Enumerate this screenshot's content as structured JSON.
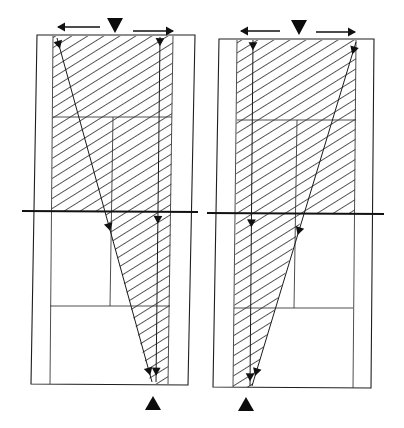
{
  "figure": {
    "colors": {
      "ink": "#111111",
      "hatch": "#444444",
      "background": "#ffffff"
    },
    "hatch": {
      "angle_deg": -32,
      "spacing": 8.5
    },
    "panels": [
      {
        "id": "left",
        "frame": [
          [
            37,
            35
          ],
          [
            195,
            35
          ],
          [
            188,
            385
          ],
          [
            31,
            384
          ]
        ],
        "hatch_regions": [
          [
            [
              53,
              36
            ],
            [
              173,
              36
            ],
            [
              171,
              211
            ],
            [
              52,
              211
            ]
          ],
          [
            [
              105,
              211
            ],
            [
              171,
              211
            ],
            [
              168,
              384
            ],
            [
              151,
              384
            ]
          ]
        ],
        "thin_lines": [
          [
            [
              53,
              36
            ],
            [
              50,
              384
            ]
          ],
          [
            [
              173,
              36
            ],
            [
              168,
              384
            ]
          ],
          [
            [
              53,
              117
            ],
            [
              172,
              117
            ]
          ],
          [
            [
              113,
              117
            ],
            [
              110,
              306
            ]
          ],
          [
            [
              50,
              306
            ],
            [
              170,
              306
            ]
          ]
        ],
        "thick_line": [
          [
            22,
            211
          ],
          [
            198,
            212
          ]
        ],
        "rays": [
          {
            "from": [
              57,
              38
            ],
            "to": [
              152,
              382
            ],
            "heads": [
              0.02,
              0.55,
              0.97
            ]
          },
          {
            "from": [
              160,
              37
            ],
            "to": [
              156,
              382
            ],
            "heads": [
              0.015,
              0.53,
              0.97
            ]
          }
        ],
        "spread_arrows": [
          {
            "from": [
              100,
              27
            ],
            "to": [
              58,
              27
            ]
          },
          {
            "from": [
              133,
              31
            ],
            "to": [
              173,
              31
            ]
          }
        ],
        "top_marker": {
          "x": 115,
          "y": 18,
          "dir": "down"
        },
        "bottom_marker": {
          "x": 153,
          "y": 396,
          "dir": "up"
        }
      },
      {
        "id": "right",
        "frame": [
          [
            219,
            39
          ],
          [
            374,
            39
          ],
          [
            371,
            388
          ],
          [
            213,
            387
          ]
        ],
        "hatch_regions": [
          [
            [
              237,
              40
            ],
            [
              356,
              40
            ],
            [
              355,
              213
            ],
            [
              236,
              213
            ]
          ],
          [
            [
              236,
              213
            ],
            [
              303,
              213
            ],
            [
              252,
              387
            ],
            [
              233,
              387
            ]
          ]
        ],
        "thin_lines": [
          [
            [
              237,
              40
            ],
            [
              233,
              387
            ]
          ],
          [
            [
              356,
              40
            ],
            [
              353,
              388
            ]
          ],
          [
            [
              237,
              120
            ],
            [
              356,
              120
            ]
          ],
          [
            [
              297,
              120
            ],
            [
              294,
              308
            ]
          ],
          [
            [
              234,
              308
            ],
            [
              353,
              308
            ]
          ]
        ],
        "thick_line": [
          [
            207,
            213
          ],
          [
            384,
            214
          ]
        ],
        "rays": [
          {
            "from": [
              253,
              40
            ],
            "to": [
              250,
              386
            ],
            "heads": [
              0.018,
              0.53,
              0.975
            ]
          },
          {
            "from": [
              356,
              42
            ],
            "to": [
              252,
              386
            ],
            "heads": [
              0.025,
              0.55,
              0.96
            ]
          }
        ],
        "spread_arrows": [
          {
            "from": [
              280,
              31
            ],
            "to": [
              241,
              31
            ]
          },
          {
            "from": [
              316,
              32
            ],
            "to": [
              355,
              32
            ]
          }
        ],
        "top_marker": {
          "x": 299,
          "y": 20,
          "dir": "down"
        },
        "bottom_marker": {
          "x": 246,
          "y": 397,
          "dir": "up"
        }
      }
    ]
  }
}
